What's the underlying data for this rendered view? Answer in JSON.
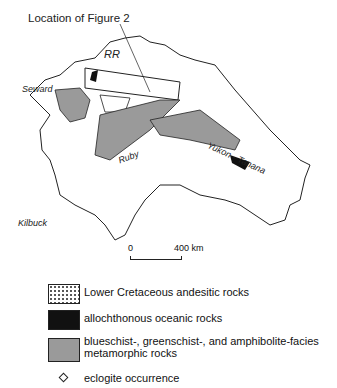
{
  "title": "Location of Figure 2",
  "labels": {
    "rr": "RR",
    "seward": "Seward",
    "ruby": "Ruby",
    "yukon": "Yukon - Tanana",
    "kilbuck": "Kilbuck"
  },
  "scale": {
    "start": "0",
    "end": "400 km"
  },
  "legend": [
    {
      "pattern": "dotted",
      "label": "Lower Cretaceous andesitic rocks"
    },
    {
      "pattern": "black",
      "label": "allochthonous oceanic rocks"
    },
    {
      "pattern": "gray",
      "label": "blueschist-, greenschist-, and amphibolite-facies metamorphic rocks"
    },
    {
      "pattern": "diamond",
      "label": "eclogite occurrence"
    }
  ]
}
